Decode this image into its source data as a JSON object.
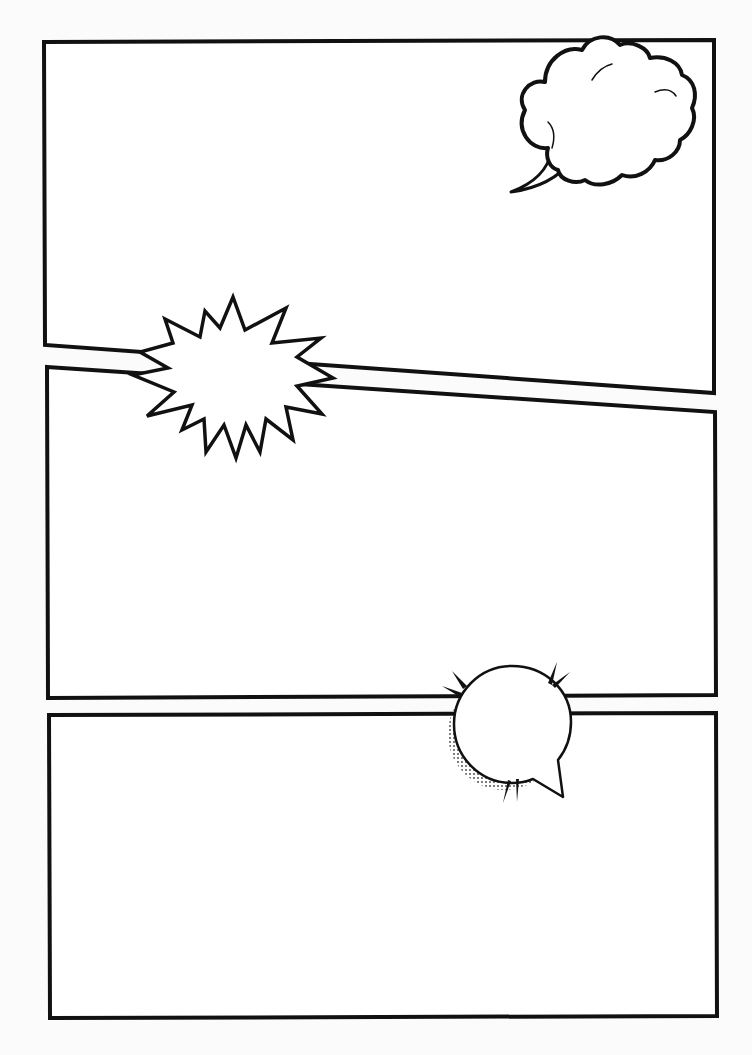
{
  "page": {
    "type": "blank comic page template",
    "background": "#fbfbfb",
    "ink_color": "#111111",
    "panel_fill": "#ffffff"
  },
  "panels": [
    {
      "id": "panel-1",
      "points": "44,42 714,40 714,393 45,345"
    },
    {
      "id": "panel-2",
      "points": "47,367 715,412 716,695 48,698"
    },
    {
      "id": "panel-3",
      "points": "49,715 716,713 717,1016 50,1018"
    }
  ],
  "balloons": [
    {
      "id": "thought-cloud",
      "kind": "cloud speech balloon",
      "panel": "panel-1",
      "text": ""
    },
    {
      "id": "burst",
      "kind": "starburst / shout balloon",
      "panel": "between panel-1 and panel-2",
      "text": ""
    },
    {
      "id": "round-speech",
      "kind": "round speech balloon with tail, halftone shadow and emphasis marks",
      "panel": "between panel-2 and panel-3",
      "text": ""
    }
  ]
}
